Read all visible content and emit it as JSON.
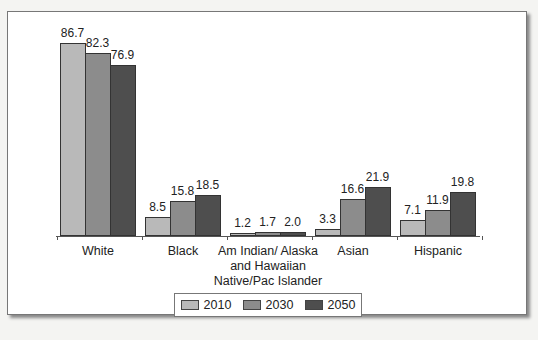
{
  "chart_data": {
    "type": "bar",
    "title": "",
    "xlabel": "",
    "ylabel": "",
    "categories": [
      "White",
      "Black",
      "Am Indian/ Alaska and Hawaiian Native/Pac Islander",
      "Asian",
      "Hispanic"
    ],
    "category_lines": [
      [
        "White"
      ],
      [
        "Black"
      ],
      [
        "Am Indian/ Alaska",
        "and Hawaiian",
        "Native/Pac Islander"
      ],
      [
        "Asian"
      ],
      [
        "Hispanic"
      ]
    ],
    "series": [
      {
        "name": "2010",
        "color": "#b9b9b9",
        "values": [
          86.7,
          8.5,
          1.2,
          3.3,
          7.1
        ]
      },
      {
        "name": "2030",
        "color": "#8c8c8c",
        "values": [
          82.3,
          15.8,
          1.7,
          16.6,
          11.9
        ]
      },
      {
        "name": "2050",
        "color": "#4e4e4e",
        "values": [
          76.9,
          18.5,
          2.0,
          21.9,
          19.8
        ]
      }
    ],
    "labels": [
      [
        "86.7",
        "8.5",
        "1.2",
        "3.3",
        "7.1"
      ],
      [
        "82.3",
        "15.8",
        "1.7",
        "16.6",
        "11.9"
      ],
      [
        "76.9",
        "18.5",
        "2.0",
        "21.9",
        "19.8"
      ]
    ],
    "ylim": [
      0,
      90
    ],
    "grid": false,
    "legend_position": "bottom"
  },
  "legend": {
    "items": [
      {
        "label": "2010",
        "color": "#b9b9b9"
      },
      {
        "label": "2030",
        "color": "#8c8c8c"
      },
      {
        "label": "2050",
        "color": "#4e4e4e"
      }
    ]
  }
}
